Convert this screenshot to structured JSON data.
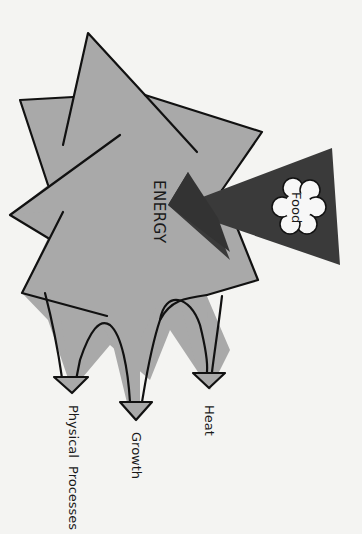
{
  "diagram": {
    "center_label": "ENERGY",
    "input": {
      "label": "Food",
      "shape": "cloud",
      "arrow_color": "#3a3a3a"
    },
    "outputs": [
      {
        "label": "Heat"
      },
      {
        "label": "Growth"
      },
      {
        "label": "Physical Processes"
      }
    ],
    "colors": {
      "background": "#f4f4f2",
      "energy_fill": "#a9a9a9",
      "outline": "#111111",
      "food_arrow": "#3a3a3a",
      "food_cloud": "#f7f7f7"
    }
  }
}
